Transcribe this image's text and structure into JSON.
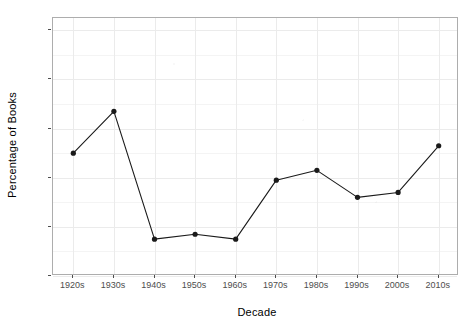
{
  "chart_data": {
    "type": "line",
    "title": "",
    "xlabel": "Decade",
    "ylabel": "Percentage of Books",
    "categories": [
      "1920s",
      "1930s",
      "1940s",
      "1950s",
      "1960s",
      "1970s",
      "1980s",
      "1990s",
      "2000s",
      "2010s"
    ],
    "values": [
      50,
      67,
      15,
      17,
      15,
      39,
      43,
      32,
      34,
      53
    ],
    "series": [
      {
        "name": "Percentage of Books",
        "values": [
          50,
          67,
          15,
          17,
          15,
          39,
          43,
          32,
          34,
          53
        ]
      }
    ],
    "ylim": [
      0,
      105
    ],
    "yticks": [
      0,
      20,
      40,
      60,
      80,
      100
    ],
    "ytick_labels": [
      "0",
      "20",
      "40",
      "60",
      "80",
      "100"
    ],
    "xtick_labels": [
      "1920s",
      "1930s",
      "1940s",
      "1950s",
      "1960s",
      "1970s",
      "1980s",
      "1990s",
      "2000s",
      "2010s"
    ],
    "grid": true,
    "legend": "none",
    "marker": "filled-circle",
    "line_color": "#1a1a1a",
    "point_color": "#1a1a1a",
    "grid_color": "#ebebeb",
    "panel_border_color": "#adadad",
    "background_color": "#ffffff",
    "tick_label_color": "#4d4d4d"
  },
  "axes": {
    "y_title": "Percentage of Books",
    "x_title": "Decade"
  }
}
